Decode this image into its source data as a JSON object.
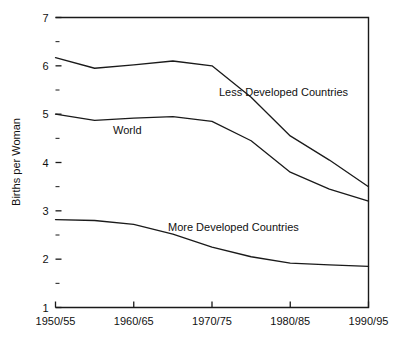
{
  "chart_data": {
    "type": "line",
    "title": "",
    "subtitle": "",
    "xlabel": "",
    "ylabel": "Births per Woman",
    "categories": [
      "1950/55",
      "1955/60",
      "1960/65",
      "1965/70",
      "1970/75",
      "1975/80",
      "1980/85",
      "1985/90",
      "1990/95"
    ],
    "xtick_labels": [
      "1950/55",
      "1960/65",
      "1970/75",
      "1980/85",
      "1990/95"
    ],
    "ytick_labels": [
      "1",
      "2",
      "3",
      "4",
      "5",
      "6",
      "7"
    ],
    "ylim": [
      1,
      7
    ],
    "ytick_values": [
      1,
      2,
      3,
      4,
      5,
      6,
      7
    ],
    "yminor_values": [
      1.5,
      2.5,
      3.5,
      4.5,
      5.5,
      6.5
    ],
    "grid": false,
    "legend_position": "inline-annotations",
    "line_color": "#1a1a1a",
    "series": [
      {
        "name": "Less Developed Countries",
        "values": [
          6.17,
          5.95,
          6.02,
          6.1,
          6.0,
          5.35,
          4.55,
          4.05,
          3.5
        ]
      },
      {
        "name": "World",
        "values": [
          5.0,
          4.87,
          4.92,
          4.95,
          4.85,
          4.45,
          3.8,
          3.45,
          3.2
        ]
      },
      {
        "name": "More Developed Countries",
        "values": [
          2.82,
          2.8,
          2.72,
          2.52,
          2.25,
          2.05,
          1.92,
          1.88,
          1.85
        ]
      }
    ],
    "annotations": [
      {
        "text": "Less Developed Countries",
        "x": 1971.5,
        "y": 5.05
      },
      {
        "text": "World",
        "x": 1961.0,
        "y": 4.47
      },
      {
        "text": "More Developed Countries",
        "x": 1968.5,
        "y": 2.52
      }
    ]
  }
}
